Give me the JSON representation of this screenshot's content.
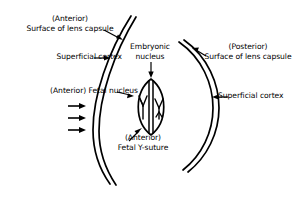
{
  "figure": {
    "background_color": "#ffffff",
    "line_color": "#000000",
    "labels": {
      "anterior_capsule_line1": "(Anterior)",
      "anterior_capsule_line2": "Surface of lens capsule",
      "superficial_cortex_left": "Superficial cortex",
      "fetal_nucleus": "(Anterior) Fetal nucleus",
      "embryonic_nucleus_line1": "Embryonic",
      "embryonic_nucleus_line2": "nucleus",
      "fetal_y_suture_line1": "(Anterior)",
      "fetal_y_suture_line2": "Fetal Y-suture",
      "posterior_capsule_line1": "(Posterior)",
      "posterior_capsule_line2": "Surface of lens capsule",
      "superficial_cortex_right": "Superficial cortex"
    },
    "structures": [
      {
        "name": "anterior-lens-capsule",
        "description": "Double-line curve on the left representing the anterior lens capsule surface"
      },
      {
        "name": "posterior-lens-capsule",
        "description": "Double-line curve on the right representing the posterior lens capsule surface"
      },
      {
        "name": "embryonic-nucleus-body",
        "description": "Central lens-shaped (biconvex) outline representing the embryonic and fetal nucleus"
      },
      {
        "name": "anterior-y-suture",
        "description": "Upright Y-shaped suture inside the left half of the nucleus"
      },
      {
        "name": "posterior-y-suture",
        "description": "Inverted Y-shaped suture inside the right half of the nucleus"
      },
      {
        "name": "incident-light-arrows",
        "description": "Three horizontal arrows at left pointing right toward the lens",
        "count": 3
      }
    ],
    "leader_arrows": [
      {
        "name": "leader-anterior-capsule",
        "from": "(Anterior) Surface of lens capsule",
        "direction": "down-right"
      },
      {
        "name": "leader-superficial-cortex-left",
        "from": "Superficial cortex",
        "direction": "right"
      },
      {
        "name": "leader-fetal-nucleus",
        "from": "(Anterior) Fetal nucleus",
        "direction": "right"
      },
      {
        "name": "leader-embryonic-nucleus",
        "from": "Embryonic nucleus",
        "direction": "down"
      },
      {
        "name": "leader-fetal-y-suture",
        "from": "(Anterior) Fetal Y-suture",
        "direction": "up-right"
      },
      {
        "name": "leader-posterior-capsule",
        "from": "(Posterior) Surface of lens capsule",
        "direction": "down-left"
      },
      {
        "name": "leader-superficial-cortex-right",
        "from": "Superficial cortex",
        "direction": "left"
      }
    ]
  }
}
